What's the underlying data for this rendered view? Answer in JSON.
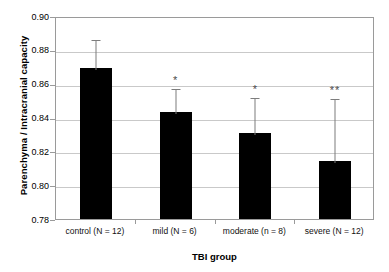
{
  "chart_data": {
    "type": "bar",
    "title": "",
    "xlabel": "TBI group",
    "ylabel": "Parenchyma / Intracranial capacity",
    "categories": [
      "control (N = 12)",
      "mild (N = 6)",
      "moderate (n = 8)",
      "severe (N = 12)"
    ],
    "values": [
      0.869,
      0.843,
      0.831,
      0.814
    ],
    "error_upper": [
      0.887,
      0.858,
      0.853,
      0.852
    ],
    "annotations": [
      "",
      "*",
      "*",
      "**"
    ],
    "ylim": [
      0.78,
      0.9
    ],
    "ytick_labels": [
      "0.90",
      "0.88",
      "0.86",
      "0.84",
      "0.82",
      "0.80",
      "0.78"
    ],
    "ytick_values": [
      0.9,
      0.88,
      0.86,
      0.84,
      0.82,
      0.8,
      0.78
    ],
    "grid": true,
    "legend": "none",
    "bar_color": "#000000",
    "error_color": "#7d7d7d",
    "grid_color": "#c9c9c9",
    "axis_color": "#9a9a9a"
  }
}
